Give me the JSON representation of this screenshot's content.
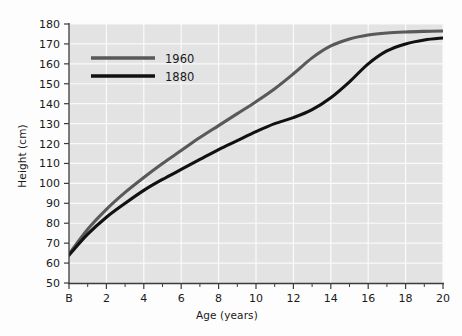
{
  "chart_data": {
    "type": "line",
    "title": "",
    "xlabel": "Age (years)",
    "ylabel": "Height (cm)",
    "xlim": [
      0,
      20
    ],
    "ylim": [
      50,
      180
    ],
    "grid": true,
    "legend_position": "top-left",
    "x_tick_labels": [
      "B",
      "2",
      "4",
      "6",
      "8",
      "10",
      "12",
      "14",
      "16",
      "18",
      "20"
    ],
    "x_tick_values": [
      0,
      2,
      4,
      6,
      8,
      10,
      12,
      14,
      16,
      18,
      20
    ],
    "x_minor_tick_values": [
      1,
      3,
      5,
      7,
      9,
      11,
      13,
      15,
      17,
      19
    ],
    "y_tick_labels": [
      "50",
      "60",
      "70",
      "80",
      "90",
      "100",
      "110",
      "120",
      "130",
      "140",
      "150",
      "160",
      "170",
      "180"
    ],
    "y_tick_values": [
      50,
      60,
      70,
      80,
      90,
      100,
      110,
      120,
      130,
      140,
      150,
      160,
      170,
      180
    ],
    "x": [
      0,
      1,
      2,
      3,
      4,
      5,
      6,
      7,
      8,
      9,
      10,
      11,
      12,
      13,
      14,
      15,
      16,
      17,
      18,
      19,
      20
    ],
    "series": [
      {
        "name": "1960",
        "color": "#58595b",
        "values": [
          64.5,
          77.0,
          87.0,
          95.5,
          103.0,
          110.0,
          116.5,
          123.0,
          129.0,
          135.0,
          141.0,
          147.5,
          155.0,
          163.0,
          169.0,
          172.5,
          174.5,
          175.5,
          176.0,
          176.3,
          176.5
        ]
      },
      {
        "name": "1880",
        "color": "#111111",
        "values": [
          64.0,
          74.5,
          83.0,
          90.0,
          96.5,
          102.0,
          107.0,
          112.0,
          117.0,
          121.5,
          126.0,
          130.0,
          133.0,
          137.0,
          143.0,
          151.0,
          160.0,
          166.5,
          170.0,
          172.0,
          173.0
        ]
      }
    ],
    "legend_entries": [
      {
        "label": "1960",
        "color": "#58595b"
      },
      {
        "label": "1880",
        "color": "#111111"
      }
    ],
    "colors": {
      "plot_background": "#e3e3e3",
      "gridline": "#fafafa",
      "axis": "#3c3c3c",
      "text": "#1a1a1a",
      "page_background": "#fdfdfd"
    }
  }
}
